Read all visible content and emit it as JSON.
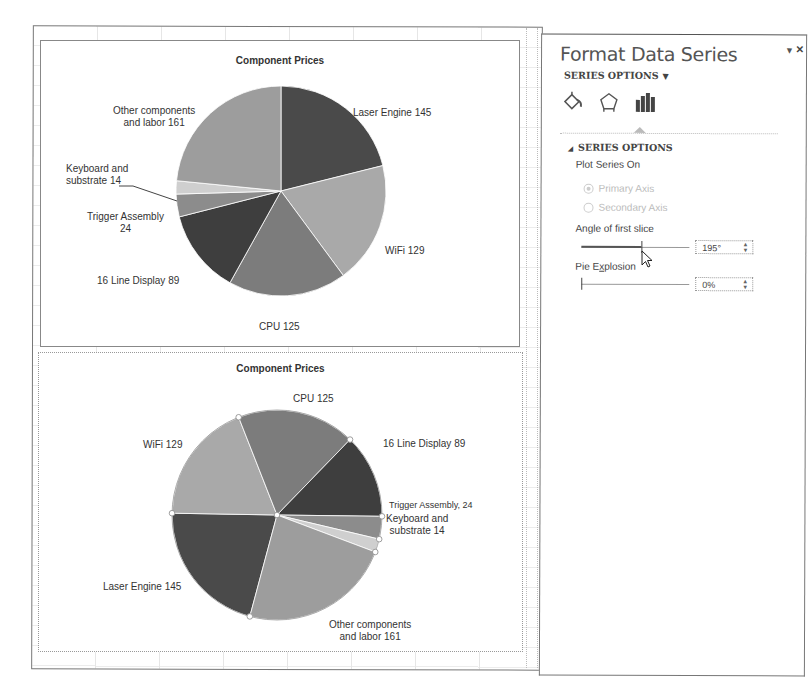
{
  "panel": {
    "title": "Format Data Series",
    "dropdown_icon": "triangle-down",
    "close_icon": "×",
    "series_options_menu": "SERIES OPTIONS",
    "tabs": [
      {
        "name": "fill-line",
        "icon": "paint-bucket-icon"
      },
      {
        "name": "effects",
        "icon": "pentagon-icon"
      },
      {
        "name": "series-options",
        "icon": "bar-chart-icon",
        "active": true
      }
    ],
    "section_title": "SERIES OPTIONS",
    "plot_series_on_label": "Plot Series On",
    "primary_axis_label": "Primary Axis",
    "secondary_axis_label": "Secondary Axis",
    "angle_label": "Angle of first slice",
    "angle_value": "195°",
    "explosion_label": "Pie Explosion",
    "explosion_value": "0%"
  },
  "chart_data": [
    {
      "type": "pie",
      "title": "Component Prices",
      "first_slice_angle": 0,
      "categories": [
        "Laser Engine",
        "WiFi",
        "CPU",
        "16 Line Display",
        "Trigger Assembly",
        "Keyboard and substrate",
        "Other components and labor"
      ],
      "values": [
        145,
        129,
        125,
        89,
        24,
        14,
        161
      ],
      "data_labels": [
        "Laser Engine 145",
        "WiFi 129",
        "CPU 125",
        "16 Line Display 89",
        "Trigger Assembly 24",
        "Keyboard and substrate 14",
        "Other components and labor 161"
      ],
      "colors": [
        "#4a4a4a",
        "#a9a9a9",
        "#7c7c7c",
        "#3e3e3e",
        "#8c8c8c",
        "#cfcfcf",
        "#9d9d9d"
      ]
    },
    {
      "type": "pie",
      "title": "Component Prices",
      "first_slice_angle": 195,
      "categories": [
        "Laser Engine",
        "WiFi",
        "CPU",
        "16 Line Display",
        "Trigger Assembly",
        "Keyboard and substrate",
        "Other components and labor"
      ],
      "values": [
        145,
        129,
        125,
        89,
        24,
        14,
        161
      ],
      "data_labels": [
        "Laser Engine 145",
        "WiFi 129",
        "CPU 125",
        "16 Line Display 89",
        "Trigger Assembly, 24",
        "Keyboard and substrate 14",
        "Other components and labor 161"
      ],
      "colors": [
        "#4a4a4a",
        "#a9a9a9",
        "#7c7c7c",
        "#3e3e3e",
        "#8c8c8c",
        "#cfcfcf",
        "#9d9d9d"
      ],
      "selected": true
    }
  ],
  "labels1": {
    "other_l1": "Other components",
    "other_l2": "and labor 161",
    "laser": "Laser Engine 145",
    "kb_l1": "Keyboard and",
    "kb_l2": "substrate 14",
    "trig_l1": "Trigger Assembly",
    "trig_l2": "24",
    "wifi": "WiFi 129",
    "display": "16 Line Display 89",
    "cpu": "CPU 125"
  },
  "labels2": {
    "cpu": "CPU 125",
    "wifi": "WiFi 129",
    "display": "16 Line Display 89",
    "trigger": "Trigger Assembly, 24",
    "kb_l1": "Keyboard and",
    "kb_l2": "substrate 14",
    "laser": "Laser Engine 145",
    "other_l1": "Other components",
    "other_l2": "and labor 161"
  }
}
